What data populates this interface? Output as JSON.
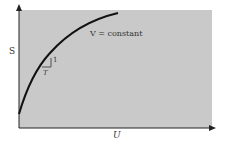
{
  "diagram": {
    "x_axis_label": "U",
    "y_axis_label": "S",
    "curve_label": "V = constant",
    "slope_rise": "1",
    "slope_run": "T",
    "colors": {
      "background": "#c9c9c9",
      "curve": "#111111",
      "axis": "#222222"
    }
  }
}
